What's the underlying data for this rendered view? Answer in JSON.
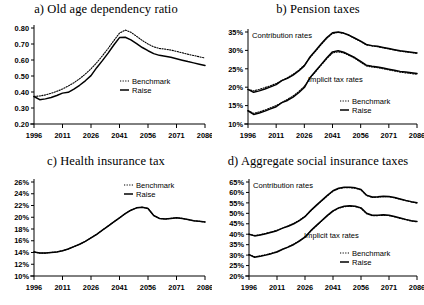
{
  "figure": {
    "legend": {
      "benchmark": "Benchmark",
      "raise": "Raise"
    },
    "series_labels": {
      "contribution": "Contribution rates",
      "implicit": "Implicit tax rates"
    },
    "colors": {
      "line": "#000000",
      "axis": "#000000",
      "background": "#ffffff"
    }
  },
  "panels": {
    "a": {
      "title": "a) Old age dependency ratio"
    },
    "b": {
      "title": "b) Pension taxes"
    },
    "c": {
      "title": "c) Health insurance tax"
    },
    "d": {
      "title": "d) Aggregate social insurance taxes"
    }
  },
  "chart_data": [
    {
      "id": "a",
      "type": "line",
      "title": "a) Old age dependency ratio",
      "xlabel": "",
      "ylabel": "",
      "xlim": [
        1996,
        2086
      ],
      "ylim": [
        0.2,
        0.8
      ],
      "xticks": [
        1996,
        2011,
        2026,
        2041,
        2056,
        2071,
        2086
      ],
      "xticklabels": [
        "1996",
        "2011",
        "2026",
        "2041",
        "2056",
        "2071",
        "2086"
      ],
      "yticks": [
        0.2,
        0.3,
        0.4,
        0.5,
        0.6,
        0.7,
        0.8
      ],
      "yticklabels": [
        "0.20",
        "0.30",
        "0.40",
        "0.50",
        "0.60",
        "0.70",
        "0.80"
      ],
      "grid": false,
      "legend": [
        "Benchmark",
        "Raise"
      ],
      "legend_position": "center-right",
      "x": [
        1996,
        1999,
        2002,
        2005,
        2008,
        2011,
        2014,
        2017,
        2020,
        2023,
        2026,
        2029,
        2032,
        2035,
        2038,
        2041,
        2044,
        2047,
        2050,
        2053,
        2056,
        2059,
        2062,
        2065,
        2068,
        2071,
        2074,
        2077,
        2080,
        2083,
        2086
      ],
      "series": [
        {
          "name": "Benchmark",
          "style": "dotted",
          "values": [
            0.372,
            0.375,
            0.382,
            0.392,
            0.404,
            0.419,
            0.437,
            0.458,
            0.483,
            0.512,
            0.545,
            0.583,
            0.626,
            0.672,
            0.721,
            0.768,
            0.787,
            0.773,
            0.748,
            0.722,
            0.7,
            0.682,
            0.672,
            0.668,
            0.662,
            0.654,
            0.645,
            0.636,
            0.628,
            0.62,
            0.612
          ]
        },
        {
          "name": "Raise",
          "style": "solid",
          "values": [
            0.372,
            0.352,
            0.357,
            0.366,
            0.378,
            0.393,
            0.398,
            0.418,
            0.442,
            0.47,
            0.502,
            0.552,
            0.596,
            0.643,
            0.694,
            0.74,
            0.742,
            0.726,
            0.702,
            0.678,
            0.658,
            0.64,
            0.629,
            0.624,
            0.617,
            0.608,
            0.599,
            0.59,
            0.582,
            0.574,
            0.566
          ]
        }
      ]
    },
    {
      "id": "b",
      "type": "line",
      "title": "b) Pension taxes",
      "xlabel": "",
      "ylabel": "",
      "xlim": [
        1996,
        2086
      ],
      "ylim": [
        10,
        35
      ],
      "xticks": [
        1996,
        2011,
        2026,
        2041,
        2056,
        2071,
        2086
      ],
      "xticklabels": [
        "1996",
        "2011",
        "2026",
        "2041",
        "2056",
        "2071",
        "2086"
      ],
      "yticks": [
        10,
        15,
        20,
        25,
        30,
        35
      ],
      "yticklabels": [
        "10%",
        "15%",
        "20%",
        "25%",
        "30%",
        "35%"
      ],
      "grid": false,
      "legend": [
        "Benchmark",
        "Raise"
      ],
      "legend_position": "bottom-right",
      "annotations": [
        "Contribution rates",
        "Implicit tax rates"
      ],
      "x": [
        1996,
        1999,
        2002,
        2005,
        2008,
        2011,
        2014,
        2017,
        2020,
        2023,
        2026,
        2029,
        2032,
        2035,
        2038,
        2041,
        2044,
        2047,
        2050,
        2053,
        2056,
        2059,
        2062,
        2065,
        2068,
        2071,
        2074,
        2077,
        2080,
        2083,
        2086
      ],
      "series": [
        {
          "name": "Contribution rates — Benchmark",
          "group": "contribution",
          "style": "dotted",
          "values": [
            19.4,
            19.0,
            19.4,
            19.9,
            20.4,
            21.0,
            21.8,
            22.6,
            23.5,
            24.6,
            26.0,
            28.0,
            29.8,
            31.6,
            33.3,
            34.6,
            34.9,
            34.6,
            34.0,
            33.2,
            32.4,
            31.5,
            31.2,
            31.0,
            30.7,
            30.4,
            30.1,
            29.8,
            29.6,
            29.4,
            29.2
          ]
        },
        {
          "name": "Contribution rates — Raise",
          "group": "contribution",
          "style": "solid",
          "values": [
            19.4,
            18.6,
            19.0,
            19.5,
            20.1,
            20.7,
            21.8,
            22.4,
            23.3,
            24.4,
            25.8,
            28.2,
            30.0,
            31.8,
            33.5,
            34.8,
            35.0,
            34.7,
            34.1,
            33.3,
            32.5,
            31.6,
            31.3,
            31.1,
            30.8,
            30.5,
            30.2,
            29.9,
            29.7,
            29.5,
            29.3
          ]
        },
        {
          "name": "Implicit tax rates — Benchmark",
          "group": "implicit",
          "style": "dotted",
          "values": [
            13.6,
            12.9,
            13.3,
            13.8,
            14.4,
            15.0,
            15.8,
            16.7,
            17.6,
            18.8,
            20.2,
            22.4,
            24.2,
            26.0,
            27.8,
            29.3,
            29.6,
            29.3,
            28.6,
            27.8,
            26.8,
            25.8,
            25.5,
            25.3,
            25.0,
            24.7,
            24.4,
            24.1,
            23.9,
            23.7,
            23.5
          ]
        },
        {
          "name": "Implicit tax rates — Raise",
          "group": "implicit",
          "style": "solid",
          "values": [
            13.6,
            12.6,
            13.0,
            13.5,
            14.1,
            14.7,
            15.8,
            16.4,
            17.3,
            18.5,
            19.9,
            22.6,
            24.4,
            26.2,
            28.0,
            29.6,
            29.9,
            29.5,
            28.8,
            28.0,
            27.0,
            26.0,
            25.7,
            25.5,
            25.2,
            24.9,
            24.6,
            24.3,
            24.1,
            23.9,
            23.7
          ]
        }
      ]
    },
    {
      "id": "c",
      "type": "line",
      "title": "c) Health insurance tax",
      "xlabel": "",
      "ylabel": "",
      "xlim": [
        1996,
        2086
      ],
      "ylim": [
        10,
        26
      ],
      "xticks": [
        1996,
        2011,
        2026,
        2041,
        2056,
        2071,
        2086
      ],
      "xticklabels": [
        "1996",
        "2011",
        "2026",
        "2041",
        "2056",
        "2071",
        "2086"
      ],
      "yticks": [
        10,
        12,
        14,
        16,
        18,
        20,
        22,
        24,
        26
      ],
      "yticklabels": [
        "10%",
        "12%",
        "14%",
        "16%",
        "18%",
        "20%",
        "22%",
        "24%",
        "26%"
      ],
      "grid": false,
      "legend": [
        "Benchmark",
        "Raise"
      ],
      "legend_position": "top-right",
      "x": [
        1996,
        1999,
        2002,
        2005,
        2008,
        2011,
        2014,
        2017,
        2020,
        2023,
        2026,
        2029,
        2032,
        2035,
        2038,
        2041,
        2044,
        2047,
        2050,
        2053,
        2056,
        2059,
        2062,
        2065,
        2068,
        2071,
        2074,
        2077,
        2080,
        2083,
        2086
      ],
      "series": [
        {
          "name": "Benchmark",
          "style": "dotted",
          "values": [
            14.1,
            13.9,
            13.9,
            14.0,
            14.1,
            14.3,
            14.6,
            15.0,
            15.4,
            15.9,
            16.5,
            17.1,
            17.8,
            18.5,
            19.2,
            19.9,
            20.6,
            21.2,
            21.6,
            21.7,
            21.5,
            20.3,
            19.8,
            19.7,
            19.8,
            19.9,
            19.8,
            19.6,
            19.4,
            19.3,
            19.2
          ]
        },
        {
          "name": "Raise",
          "style": "solid",
          "values": [
            14.1,
            13.9,
            13.9,
            14.0,
            14.1,
            14.3,
            14.6,
            15.0,
            15.4,
            15.9,
            16.5,
            17.1,
            17.8,
            18.5,
            19.2,
            19.9,
            20.6,
            21.2,
            21.6,
            21.7,
            21.5,
            20.3,
            19.8,
            19.7,
            19.8,
            19.9,
            19.8,
            19.6,
            19.4,
            19.3,
            19.2
          ]
        }
      ]
    },
    {
      "id": "d",
      "type": "line",
      "title": "d) Aggregate social insurance taxes",
      "xlabel": "",
      "ylabel": "",
      "xlim": [
        1996,
        2086
      ],
      "ylim": [
        20,
        65
      ],
      "xticks": [
        1996,
        2011,
        2026,
        2041,
        2056,
        2071,
        2086
      ],
      "xticklabels": [
        "1996",
        "2011",
        "2026",
        "2041",
        "2056",
        "2071",
        "2086"
      ],
      "yticks": [
        20,
        25,
        30,
        35,
        40,
        45,
        50,
        55,
        60,
        65
      ],
      "yticklabels": [
        "20%",
        "25%",
        "30%",
        "35%",
        "40%",
        "45%",
        "50%",
        "55%",
        "60%",
        "65%"
      ],
      "grid": false,
      "legend": [
        "Benchmark",
        "Raise"
      ],
      "legend_position": "bottom-right",
      "annotations": [
        "Contribution rates",
        "Implicit tax rates"
      ],
      "x": [
        1996,
        1999,
        2002,
        2005,
        2008,
        2011,
        2014,
        2017,
        2020,
        2023,
        2026,
        2029,
        2032,
        2035,
        2038,
        2041,
        2044,
        2047,
        2050,
        2053,
        2056,
        2059,
        2062,
        2065,
        2068,
        2071,
        2074,
        2077,
        2080,
        2083,
        2086
      ],
      "series": [
        {
          "name": "Contribution rates — Benchmark",
          "group": "contribution",
          "style": "dotted",
          "values": [
            40.0,
            39.4,
            39.8,
            40.4,
            41.1,
            41.9,
            42.9,
            44.0,
            45.2,
            46.7,
            48.6,
            51.1,
            53.6,
            56.0,
            58.4,
            60.6,
            61.8,
            62.3,
            62.3,
            62.0,
            61.2,
            58.5,
            57.6,
            57.7,
            58.0,
            57.9,
            57.4,
            56.7,
            56.0,
            55.4,
            54.9
          ]
        },
        {
          "name": "Contribution rates — Raise",
          "group": "contribution",
          "style": "solid",
          "values": [
            40.0,
            39.2,
            39.6,
            40.2,
            40.9,
            41.7,
            42.9,
            43.8,
            45.0,
            46.5,
            48.4,
            51.3,
            53.8,
            56.2,
            58.6,
            60.8,
            62.0,
            62.5,
            62.5,
            62.2,
            61.4,
            58.7,
            57.8,
            57.9,
            58.2,
            58.1,
            57.6,
            56.9,
            56.2,
            55.6,
            55.1
          ]
        },
        {
          "name": "Implicit tax rates — Benchmark",
          "group": "implicit",
          "style": "dotted",
          "values": [
            30.2,
            29.2,
            29.6,
            30.2,
            30.9,
            31.7,
            32.8,
            34.0,
            35.3,
            36.9,
            38.8,
            41.4,
            43.9,
            46.4,
            48.8,
            51.0,
            52.4,
            53.2,
            53.4,
            53.2,
            52.4,
            49.8,
            48.9,
            48.9,
            49.1,
            48.9,
            48.3,
            47.6,
            46.9,
            46.3,
            45.9
          ]
        },
        {
          "name": "Implicit tax rates — Raise",
          "group": "implicit",
          "style": "solid",
          "values": [
            30.2,
            29.0,
            29.4,
            30.0,
            30.7,
            31.5,
            32.8,
            33.8,
            35.1,
            36.7,
            38.6,
            41.6,
            44.1,
            46.6,
            49.0,
            51.2,
            52.6,
            53.4,
            53.6,
            53.4,
            52.6,
            50.0,
            49.1,
            49.1,
            49.3,
            49.1,
            48.5,
            47.8,
            47.1,
            46.5,
            46.1
          ]
        }
      ]
    }
  ]
}
